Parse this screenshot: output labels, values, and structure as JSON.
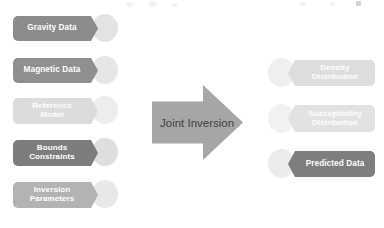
{
  "diagram": {
    "background": "#ffffff",
    "process": {
      "label": "Joint Inversion",
      "shape": "block-arrow",
      "fill": "#a6a6a6",
      "text_color": "#3f3f3f"
    },
    "inputs": [
      {
        "label": "Gravity Data",
        "lines": [
          "Gravity Data"
        ],
        "fill": "#8c8c8c",
        "circle_fill": "#e3e3e3",
        "text_color": "#ffffff",
        "font_size": 8.2
      },
      {
        "label": "Magnetic Data",
        "lines": [
          "Magnetic Data"
        ],
        "fill": "#8f8f8f",
        "circle_fill": "#e6e6e6",
        "text_color": "#ffffff",
        "font_size": 8.2
      },
      {
        "label": "Reference Model",
        "lines": [
          "Reference",
          "Model"
        ],
        "fill": "#dcdcdc",
        "circle_fill": "#ededed",
        "text_color": "#ffffff",
        "font_size": 8.0
      },
      {
        "label": "Bounds Constraints",
        "lines": [
          "Bounds",
          "Constraints"
        ],
        "fill": "#7d7d7d",
        "circle_fill": "#dedede",
        "text_color": "#ffffff",
        "font_size": 8.0
      },
      {
        "label": "Inversion Parameters",
        "lines": [
          "Inversion",
          "Parameters"
        ],
        "fill": "#b3b3b3",
        "circle_fill": "#e8e8e8",
        "text_color": "#ffffff",
        "font_size": 8.0
      }
    ],
    "outputs": [
      {
        "label": "Density Distribution",
        "lines": [
          "Density",
          "Distribution"
        ],
        "fill": "#dddddd",
        "circle_fill": "#efefef",
        "text_color": "#ffffff",
        "font_size": 8.0
      },
      {
        "label": "Susceptibility Distribution",
        "lines": [
          "Susceptibility",
          "Distribution"
        ],
        "fill": "#e2e2e2",
        "circle_fill": "#f1f1f1",
        "text_color": "#ffffff",
        "font_size": 8.0
      },
      {
        "label": "Predicted Data",
        "lines": [
          "Predicted Data"
        ],
        "fill": "#7e7e7e",
        "circle_fill": "#ececec",
        "text_color": "#ffffff",
        "font_size": 8.2
      }
    ]
  }
}
